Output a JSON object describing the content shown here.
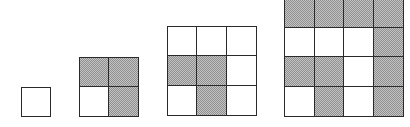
{
  "figure": {
    "shade_color": "#b8b8b8",
    "line_color": "#2a2a2a",
    "grids": [
      {
        "size": 1,
        "x": 21,
        "y": 87,
        "cell": 30,
        "rows": [
          [
            "W"
          ]
        ]
      },
      {
        "size": 2,
        "x": 79,
        "y": 57,
        "cell": 30,
        "rows": [
          [
            "S",
            "S"
          ],
          [
            "W",
            "S"
          ]
        ]
      },
      {
        "size": 3,
        "x": 167,
        "y": 26,
        "cell": 30,
        "rows": [
          [
            "W",
            "W",
            "W"
          ],
          [
            "S",
            "S",
            "W"
          ],
          [
            "W",
            "S",
            "W"
          ]
        ]
      },
      {
        "size": 4,
        "x": 284,
        "y": -3,
        "cell": 30,
        "rows": [
          [
            "S",
            "S",
            "S",
            "S"
          ],
          [
            "W",
            "W",
            "W",
            "S"
          ],
          [
            "S",
            "S",
            "W",
            "S"
          ],
          [
            "W",
            "S",
            "W",
            "S"
          ]
        ]
      }
    ]
  }
}
